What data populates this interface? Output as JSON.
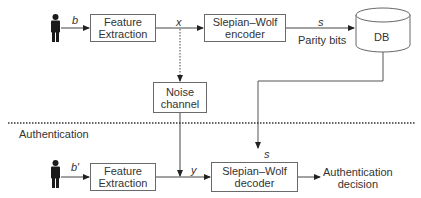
{
  "enrollment": {
    "user_input_label": "b",
    "feature_extraction": {
      "line1": "Feature",
      "line2": "Extraction"
    },
    "feature_output_label": "x",
    "encoder": {
      "line1": "Slepian–Wolf",
      "line2": "encoder"
    },
    "encoder_output_label": "s",
    "parity_label": "Parity bits",
    "database": "DB"
  },
  "noise_channel": {
    "line1": "Noise",
    "line2": "channel"
  },
  "divider": {
    "section_label": "Authentication"
  },
  "authentication": {
    "user_input_label": "b′",
    "feature_extraction": {
      "line1": "Feature",
      "line2": "Extraction"
    },
    "feature_output_label": "y",
    "db_to_decoder_label": "s",
    "decoder": {
      "line1": "Slepian–Wolf",
      "line2": "decoder"
    },
    "decision": {
      "line1": "Authentication",
      "line2": "decision"
    }
  }
}
